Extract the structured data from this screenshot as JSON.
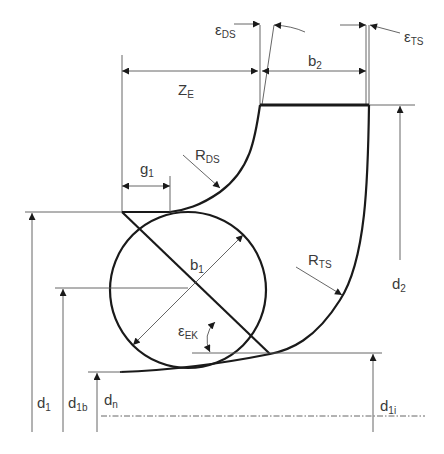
{
  "diagram": {
    "type": "impeller meridional section geometry",
    "colors": {
      "line": "#1a1a1a",
      "dimension": "#555555",
      "text": "#3a3a3a",
      "background": "#ffffff"
    },
    "labels": {
      "eps_ds": {
        "main": "ε",
        "sub": "DS"
      },
      "eps_ts": {
        "main": "ε",
        "sub": "TS"
      },
      "z_e": {
        "main": "Z",
        "sub": "E"
      },
      "b2": {
        "main": "b",
        "sub": "2"
      },
      "g1": {
        "main": "g",
        "sub": "1"
      },
      "r_ds": {
        "main": "R",
        "sub": "DS"
      },
      "r_ts": {
        "main": "R",
        "sub": "TS"
      },
      "b1": {
        "main": "b",
        "sub": "1"
      },
      "eps_ek": {
        "main": "ε",
        "sub": "EK"
      },
      "d2": {
        "main": "d",
        "sub": "2"
      },
      "d1": {
        "main": "d",
        "sub": "1"
      },
      "d1b": {
        "main": "d",
        "sub": "1b"
      },
      "dn": {
        "main": "d",
        "sub": "n"
      },
      "d1i": {
        "main": "d",
        "sub": "1i"
      }
    }
  }
}
